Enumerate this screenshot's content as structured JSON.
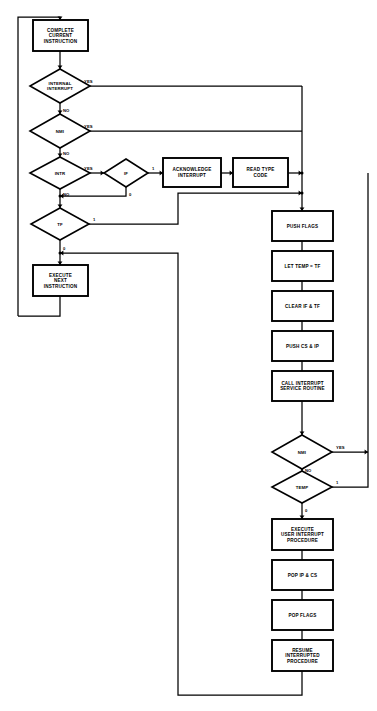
{
  "diagram": {
    "canvas": {
      "width": 377,
      "height": 711
    },
    "colors": {
      "background": "#ffffff",
      "stroke": "#000000",
      "node_fill": "#ffffff",
      "text": "#000000"
    },
    "nodes": {
      "complete_current_instruction": {
        "label_lines": [
          "COMPLETE",
          "CURRENT",
          "INSTRUCTION"
        ],
        "shape": "process",
        "x": 33,
        "y": 20,
        "w": 55,
        "h": 31
      },
      "internal_interrupt": {
        "label_lines": [
          "INTERNAL",
          "INTERRUPT"
        ],
        "shape": "decision",
        "cx": 60,
        "cy": 86,
        "rx": 30,
        "ry": 17
      },
      "nmi_top": {
        "label_lines": [
          "NMI"
        ],
        "shape": "decision",
        "cx": 60,
        "cy": 131,
        "rx": 30,
        "ry": 17
      },
      "intr": {
        "label_lines": [
          "INTR"
        ],
        "shape": "decision",
        "cx": 60,
        "cy": 173,
        "rx": 30,
        "ry": 16
      },
      "if_flag": {
        "label_lines": [
          "IF"
        ],
        "shape": "decision",
        "cx": 126,
        "cy": 173,
        "rx": 22,
        "ry": 14
      },
      "acknowledge_interrupt": {
        "label_lines": [
          "ACKNOWLEDGE",
          "INTERRUPT"
        ],
        "shape": "process",
        "x": 163,
        "y": 158,
        "w": 58,
        "h": 29
      },
      "read_type_code": {
        "label_lines": [
          "READ TYPE",
          "CODE"
        ],
        "shape": "process",
        "x": 233,
        "y": 158,
        "w": 55,
        "h": 29
      },
      "tf_flag": {
        "label_lines": [
          "TF"
        ],
        "shape": "decision",
        "cx": 60,
        "cy": 224,
        "rx": 29,
        "ry": 16
      },
      "execute_next_instruction": {
        "label_lines": [
          "EXECUTE",
          "NEXT",
          "INSTRUCTION"
        ],
        "shape": "process",
        "x": 33,
        "y": 265,
        "w": 55,
        "h": 31
      },
      "push_flags": {
        "label_lines": [
          "PUSH FLAGS"
        ],
        "shape": "process",
        "x": 272,
        "y": 211,
        "w": 61,
        "h": 30
      },
      "let_temp_tf": {
        "label_lines": [
          "LET TEMP = TF"
        ],
        "shape": "process",
        "x": 272,
        "y": 251,
        "w": 61,
        "h": 30
      },
      "clear_if_tf": {
        "label_lines": [
          "CLEAR IF & TF"
        ],
        "shape": "process",
        "x": 272,
        "y": 291,
        "w": 61,
        "h": 30
      },
      "push_cs_ip": {
        "label_lines": [
          "PUSH CS & IP"
        ],
        "shape": "process",
        "x": 272,
        "y": 331,
        "w": 61,
        "h": 30
      },
      "call_interrupt_service_routine": {
        "label_lines": [
          "CALL INTERRUPT",
          "SERVICE ROUTINE"
        ],
        "shape": "process",
        "x": 272,
        "y": 371,
        "w": 61,
        "h": 30
      },
      "nmi_check": {
        "label_lines": [
          "NMI"
        ],
        "shape": "decision",
        "cx": 302,
        "cy": 452,
        "rx": 30,
        "ry": 17
      },
      "temp_check": {
        "label_lines": [
          "TEMP"
        ],
        "shape": "decision",
        "cx": 302,
        "cy": 487,
        "rx": 30,
        "ry": 16
      },
      "execute_user_interrupt_procedure": {
        "label_lines": [
          "EXECUTE",
          "USER INTERRUPT",
          "PROCEDURE"
        ],
        "shape": "process",
        "x": 272,
        "y": 519,
        "w": 61,
        "h": 31
      },
      "pop_ip_cs": {
        "label_lines": [
          "POP IP & CS"
        ],
        "shape": "process",
        "x": 272,
        "y": 560,
        "w": 61,
        "h": 30
      },
      "pop_flags": {
        "label_lines": [
          "POP FLAGS"
        ],
        "shape": "process",
        "x": 272,
        "y": 600,
        "w": 61,
        "h": 30
      },
      "resume_interrupted_procedure": {
        "label_lines": [
          "RESUME",
          "INTERRUPTED",
          "PROCEDURE"
        ],
        "shape": "process",
        "x": 272,
        "y": 640,
        "w": 61,
        "h": 31
      }
    },
    "edge_labels": [
      {
        "name": "internal-interrupt-yes",
        "text": "YES",
        "x": 84,
        "y": 83
      },
      {
        "name": "internal-interrupt-no",
        "text": "NO",
        "x": 63,
        "y": 112
      },
      {
        "name": "nmi-top-yes",
        "text": "YES",
        "x": 84,
        "y": 128
      },
      {
        "name": "nmi-top-no",
        "text": "NO",
        "x": 63,
        "y": 155
      },
      {
        "name": "intr-yes",
        "text": "YES",
        "x": 84,
        "y": 170
      },
      {
        "name": "intr-no",
        "text": "NO",
        "x": 63,
        "y": 196
      },
      {
        "name": "if-one",
        "text": "1",
        "x": 152,
        "y": 170
      },
      {
        "name": "if-zero",
        "text": "0",
        "x": 129,
        "y": 196
      },
      {
        "name": "tf-one",
        "text": "1",
        "x": 93,
        "y": 221
      },
      {
        "name": "tf-zero",
        "text": "0",
        "x": 63,
        "y": 250
      },
      {
        "name": "nmi-check-yes",
        "text": "YES",
        "x": 336,
        "y": 449
      },
      {
        "name": "nmi-check-no",
        "text": "NO",
        "x": 305,
        "y": 472
      },
      {
        "name": "temp-one",
        "text": "1",
        "x": 336,
        "y": 484
      },
      {
        "name": "temp-zero",
        "text": "0",
        "x": 305,
        "y": 512
      }
    ],
    "connectors": [
      {
        "name": "top-loop-into-complete",
        "points": "18,316 18,17 60,17 60,20",
        "arrow": "down",
        "arrow_at": "60,20"
      },
      {
        "name": "complete-to-internal-interrupt",
        "points": "60,51 60,69",
        "arrow": "down",
        "arrow_at": "60,69"
      },
      {
        "name": "internal-interrupt-yes-right",
        "points": "90,86 302,86",
        "arrow": "none"
      },
      {
        "name": "internal-interrupt-no-down",
        "points": "60,103 60,114",
        "arrow": "down",
        "arrow_at": "60,114"
      },
      {
        "name": "nmi-top-yes-right",
        "points": "90,131 302,131",
        "arrow": "none"
      },
      {
        "name": "nmi-top-no-down",
        "points": "60,148 60,157",
        "arrow": "down",
        "arrow_at": "60,157"
      },
      {
        "name": "intr-yes-to-if",
        "points": "90,173 104,173",
        "arrow": "right",
        "arrow_at": "104,173"
      },
      {
        "name": "if-one-to-acknowledge",
        "points": "148,173 163,173",
        "arrow": "right",
        "arrow_at": "163,173"
      },
      {
        "name": "acknowledge-to-read",
        "points": "221,173 233,173",
        "arrow": "right",
        "arrow_at": "233,173"
      },
      {
        "name": "read-to-merge",
        "points": "288,173 302,173",
        "arrow": "right",
        "arrow_at": "302,173"
      },
      {
        "name": "if-zero-back-to-intr-no",
        "points": "126,187 126,196 60,196",
        "arrow": "left",
        "arrow_at": "60,196"
      },
      {
        "name": "intr-no-down-to-tf",
        "points": "60,189 60,208",
        "arrow": "down",
        "arrow_at": "60,208"
      },
      {
        "name": "tf-one-to-merge",
        "points": "89,224 178,224 178,193 302,193",
        "arrow": "right",
        "arrow_at": "302,193"
      },
      {
        "name": "tf-zero-down",
        "points": "60,240 60,265",
        "arrow": "down",
        "arrow_at": "60,265"
      },
      {
        "name": "merge-column-down-to-push-flags",
        "points": "302,86 302,211",
        "arrow": "down",
        "arrow_at": "302,211"
      },
      {
        "name": "push-flags-to-let-temp",
        "points": "302,241 302,251",
        "arrow": "none"
      },
      {
        "name": "let-temp-to-clear",
        "points": "302,281 302,291",
        "arrow": "none"
      },
      {
        "name": "clear-to-push-cs-ip",
        "points": "302,321 302,331",
        "arrow": "none"
      },
      {
        "name": "push-cs-ip-to-call",
        "points": "302,361 302,371",
        "arrow": "none"
      },
      {
        "name": "call-to-nmi-check",
        "points": "302,401 302,435",
        "arrow": "down",
        "arrow_at": "302,435"
      },
      {
        "name": "nmi-check-yes-right",
        "points": "332,452 368,452",
        "arrow": "right",
        "arrow_at": "368,452"
      },
      {
        "name": "nmi-check-no-down",
        "points": "302,469 302,471",
        "arrow": "down",
        "arrow_at": "302,471"
      },
      {
        "name": "temp-one-right-up",
        "points": "332,487 368,487 368,173",
        "arrow": "none"
      },
      {
        "name": "temp-zero-down",
        "points": "302,503 302,519",
        "arrow": "down",
        "arrow_at": "302,519"
      },
      {
        "name": "execute-user-to-pop-ip",
        "points": "302,550 302,560",
        "arrow": "none"
      },
      {
        "name": "pop-ip-to-pop-flags",
        "points": "302,590 302,600",
        "arrow": "none"
      },
      {
        "name": "pop-flags-to-resume",
        "points": "302,630 302,640",
        "arrow": "none"
      },
      {
        "name": "resume-loop-back",
        "points": "302,671 302,695 178,695 178,253 60,253",
        "arrow": "left",
        "arrow_at": "60,253"
      },
      {
        "name": "execute-next-loop-out",
        "points": "60,296 60,316 18,316",
        "arrow": "none"
      }
    ],
    "junctions": [
      {
        "name": "merge-junction-read",
        "x": 302,
        "y": 173
      },
      {
        "name": "merge-junction-tf",
        "x": 302,
        "y": 193
      },
      {
        "name": "intr-no-junction",
        "x": 60,
        "y": 196
      },
      {
        "name": "tf-zero-junction",
        "x": 60,
        "y": 253
      }
    ]
  }
}
